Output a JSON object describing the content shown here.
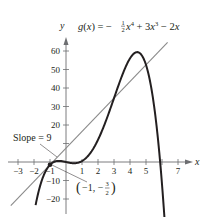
{
  "chart_data": {
    "type": "line",
    "title_parts": {
      "lhs": "g(x) = −",
      "frac_num": "1",
      "frac_den": "2",
      "term1": "x",
      "exp1": "4",
      "mid": " + 3x",
      "exp2": "3",
      "tail": " − 2x"
    },
    "xlabel": "x",
    "ylabel": "y",
    "xlim": [
      -3.3,
      7.7
    ],
    "ylim": [
      -25,
      68
    ],
    "x_ticks": [
      -3,
      -2,
      -1,
      1,
      2,
      3,
      4,
      5,
      7
    ],
    "x_tick_marks": [
      -3,
      -2,
      -1,
      1,
      2,
      3,
      4,
      5,
      6,
      7
    ],
    "y_ticks": [
      -20,
      -10,
      20,
      30,
      40,
      50,
      60
    ],
    "y_tick_marks": [
      -20,
      -10,
      10,
      20,
      30,
      40,
      50,
      60
    ],
    "grid": false,
    "series": [
      {
        "name": "g(x)",
        "function": "-0.5x^4 + 3x^3 - 2x",
        "coefficients": {
          "x4": -0.5,
          "x3": 3,
          "x2": 0,
          "x1": -2,
          "x0": 0
        },
        "x_range": [
          -1.9,
          6.15
        ],
        "color": "#231f20",
        "x": [
          -1.9,
          -1.5,
          -1,
          -0.5,
          0,
          0.5,
          1,
          1.5,
          2,
          2.5,
          3,
          3.5,
          4,
          4.5,
          5,
          5.5,
          6,
          6.15
        ],
        "y": [
          -23.3,
          -10.6,
          -1.5,
          0.6,
          0,
          -0.7,
          0.5,
          4.6,
          12,
          23.9,
          34.5,
          46.8,
          56,
          59.3,
          52.5,
          29.9,
          -12,
          -27.3
        ]
      },
      {
        "name": "Tangent line at x = -1",
        "function": "9(x + 1) - 1.5",
        "slope": 9,
        "point": [
          -1,
          -1.5
        ],
        "x_range": [
          -3.45,
          6.35
        ],
        "color": "#8a8a8a"
      }
    ],
    "annotations": [
      {
        "text": "Slope = 9",
        "target": [
          -1,
          -1.5
        ]
      },
      {
        "text": "(−1, −3/2)",
        "target": [
          -1,
          -1.5
        ]
      }
    ]
  },
  "labels": {
    "slope": "Slope = 9",
    "point_open": "(",
    "point_x": "−1, −",
    "point_num": "3",
    "point_den": "2",
    "point_close": ")"
  }
}
